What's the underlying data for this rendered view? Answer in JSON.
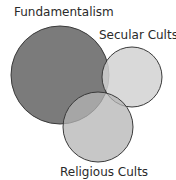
{
  "diagram": {
    "type": "venn",
    "sets": [
      {
        "id": "fundamentalism",
        "label": "Fundamentalism",
        "color": "#7b7b7b"
      },
      {
        "id": "secular",
        "label": "Secular Cults",
        "color": "#d2d2d2"
      },
      {
        "id": "religious",
        "label": "Religious Cults",
        "color": "#b4b4b4"
      }
    ],
    "outline_color": "#3a3a3a"
  }
}
